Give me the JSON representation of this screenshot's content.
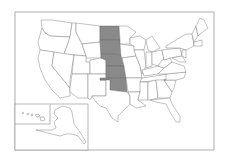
{
  "map": {
    "title": "United States map with highlighted Great Plains states",
    "highlight_color": "#8a8a8a",
    "base_color": "#ffffff",
    "border_color": "#777777",
    "highlighted_states": [
      "North Dakota",
      "South Dakota",
      "Nebraska",
      "Kansas",
      "Oklahoma"
    ],
    "insets": [
      "Hawaii",
      "Alaska"
    ]
  }
}
